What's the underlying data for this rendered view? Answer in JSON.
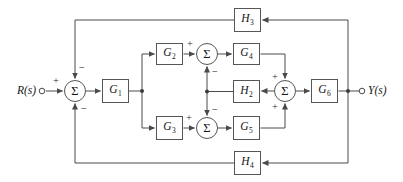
{
  "labels": {
    "input": "R(s)",
    "output": "Y(s)",
    "sigma": "Σ",
    "plus": "+",
    "minus": "−"
  },
  "blocks": {
    "g1": {
      "base": "G",
      "sub": "1"
    },
    "g2": {
      "base": "G",
      "sub": "2"
    },
    "g3": {
      "base": "G",
      "sub": "3"
    },
    "g4": {
      "base": "G",
      "sub": "4"
    },
    "g5": {
      "base": "G",
      "sub": "5"
    },
    "g6": {
      "base": "G",
      "sub": "6"
    },
    "h2": {
      "base": "H",
      "sub": "2"
    },
    "h3": {
      "base": "H",
      "sub": "3"
    },
    "h4": {
      "base": "H",
      "sub": "4"
    }
  },
  "colors": {
    "background": "#ffffff",
    "line": "#4a4a4a",
    "box_border": "#565656",
    "text": "#151515"
  }
}
